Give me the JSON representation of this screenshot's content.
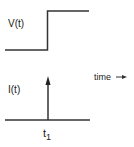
{
  "diagram": {
    "voltage_label": "V(t)",
    "current_label": "I(t)",
    "time_axis_label": "time",
    "time_arrow_glyph": "→",
    "marker_label_base": "t",
    "marker_label_subscript": "1",
    "line_color": "#333333",
    "voltage_waveform": "step",
    "current_waveform": "impulse"
  }
}
